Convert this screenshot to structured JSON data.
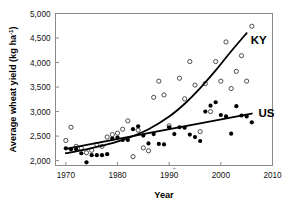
{
  "chart_data": {
    "type": "scatter",
    "title": "",
    "xlabel": "Year",
    "ylabel": "Average wheat yield (kg ha-1)",
    "ylabel_main": "Average wheat yield (kg ha",
    "ylabel_sup": "-1",
    "ylabel_tail": ")",
    "xlim": [
      1968,
      2010
    ],
    "ylim": [
      1900,
      5000
    ],
    "xticks": [
      1970,
      1980,
      1990,
      2000,
      2010
    ],
    "xtick_labels": [
      "1970",
      "1980",
      "1990",
      "2000",
      "2010"
    ],
    "yticks": [
      2000,
      2500,
      3000,
      3500,
      4000,
      4500,
      5000
    ],
    "ytick_labels": [
      "2,000",
      "2,500",
      "3,000",
      "3,500",
      "4,000",
      "4,500",
      "5,000"
    ],
    "grid": false,
    "legend_position": "inline-right",
    "colors": {
      "axis": "#8a8a8a",
      "marker_open_stroke": "#3b3b3b",
      "marker_filled": "#000000",
      "trend_line": "#000000",
      "text": "#111111"
    },
    "series": [
      {
        "name": "KY",
        "marker": "open-circle",
        "label": "KY",
        "label_x": 2005.0,
        "label_y": 4460,
        "points": [
          {
            "x": 1970,
            "y": 2410
          },
          {
            "x": 1971,
            "y": 2680
          },
          {
            "x": 1972,
            "y": 2290
          },
          {
            "x": 1973,
            "y": 2250
          },
          {
            "x": 1974,
            "y": 2160
          },
          {
            "x": 1975,
            "y": 2210
          },
          {
            "x": 1976,
            "y": 2330
          },
          {
            "x": 1977,
            "y": 2290
          },
          {
            "x": 1978,
            "y": 2480
          },
          {
            "x": 1979,
            "y": 2530
          },
          {
            "x": 1980,
            "y": 2560
          },
          {
            "x": 1981,
            "y": 2640
          },
          {
            "x": 1982,
            "y": 2810
          },
          {
            "x": 1983,
            "y": 2080
          },
          {
            "x": 1984,
            "y": 2620
          },
          {
            "x": 1985,
            "y": 2260
          },
          {
            "x": 1986,
            "y": 2200
          },
          {
            "x": 1987,
            "y": 3290
          },
          {
            "x": 1988,
            "y": 3620
          },
          {
            "x": 1989,
            "y": 3340
          },
          {
            "x": 1990,
            "y": 2710
          },
          {
            "x": 1991,
            "y": 1800
          },
          {
            "x": 1992,
            "y": 3680
          },
          {
            "x": 1993,
            "y": 3260
          },
          {
            "x": 1994,
            "y": 4020
          },
          {
            "x": 1995,
            "y": 3540
          },
          {
            "x": 1996,
            "y": 2590
          },
          {
            "x": 1997,
            "y": 3570
          },
          {
            "x": 1998,
            "y": 3000
          },
          {
            "x": 1999,
            "y": 4020
          },
          {
            "x": 2000,
            "y": 3620
          },
          {
            "x": 2001,
            "y": 4420
          },
          {
            "x": 2002,
            "y": 3470
          },
          {
            "x": 2003,
            "y": 3820
          },
          {
            "x": 2004,
            "y": 4140
          },
          {
            "x": 2005,
            "y": 3620
          },
          {
            "x": 2006,
            "y": 4740
          }
        ],
        "trend": {
          "type": "exponential",
          "points": [
            {
              "x": 1970,
              "y": 2150
            },
            {
              "x": 1974,
              "y": 2230
            },
            {
              "x": 1978,
              "y": 2330
            },
            {
              "x": 1982,
              "y": 2460
            },
            {
              "x": 1986,
              "y": 2640
            },
            {
              "x": 1990,
              "y": 2900
            },
            {
              "x": 1993,
              "y": 3160
            },
            {
              "x": 1996,
              "y": 3480
            },
            {
              "x": 1999,
              "y": 3840
            },
            {
              "x": 2002,
              "y": 4230
            },
            {
              "x": 2005,
              "y": 4600
            }
          ]
        }
      },
      {
        "name": "US",
        "marker": "filled-circle",
        "label": "US",
        "label_x": 2006.5,
        "label_y": 2980,
        "points": [
          {
            "x": 1970,
            "y": 2250
          },
          {
            "x": 1971,
            "y": 2230
          },
          {
            "x": 1972,
            "y": 2230
          },
          {
            "x": 1973,
            "y": 2150
          },
          {
            "x": 1974,
            "y": 1965
          },
          {
            "x": 1975,
            "y": 2110
          },
          {
            "x": 1976,
            "y": 2110
          },
          {
            "x": 1977,
            "y": 2110
          },
          {
            "x": 1978,
            "y": 2130
          },
          {
            "x": 1979,
            "y": 2450
          },
          {
            "x": 1980,
            "y": 2470
          },
          {
            "x": 1981,
            "y": 2420
          },
          {
            "x": 1982,
            "y": 2420
          },
          {
            "x": 1983,
            "y": 2640
          },
          {
            "x": 1984,
            "y": 2700
          },
          {
            "x": 1985,
            "y": 2510
          },
          {
            "x": 1986,
            "y": 2350
          },
          {
            "x": 1987,
            "y": 2540
          },
          {
            "x": 1988,
            "y": 2340
          },
          {
            "x": 1989,
            "y": 2330
          },
          {
            "x": 1990,
            "y": 2680
          },
          {
            "x": 1991,
            "y": 2540
          },
          {
            "x": 1992,
            "y": 2680
          },
          {
            "x": 1993,
            "y": 2670
          },
          {
            "x": 1994,
            "y": 2530
          },
          {
            "x": 1995,
            "y": 2480
          },
          {
            "x": 1996,
            "y": 2400
          },
          {
            "x": 1997,
            "y": 3000
          },
          {
            "x": 1998,
            "y": 3120
          },
          {
            "x": 1999,
            "y": 3190
          },
          {
            "x": 2000,
            "y": 2930
          },
          {
            "x": 2001,
            "y": 2900
          },
          {
            "x": 2002,
            "y": 2550
          },
          {
            "x": 2003,
            "y": 3110
          },
          {
            "x": 2004,
            "y": 2920
          },
          {
            "x": 2005,
            "y": 2900
          },
          {
            "x": 2006,
            "y": 2780
          }
        ],
        "trend": {
          "type": "linear",
          "points": [
            {
              "x": 1970,
              "y": 2240
            },
            {
              "x": 2006,
              "y": 2960
            }
          ]
        }
      }
    ]
  }
}
